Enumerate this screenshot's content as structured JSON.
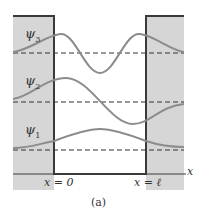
{
  "figure": {
    "caption": "(a)",
    "colors": {
      "barrier_fill": "#d6d6d6",
      "outline": "#3a3a3a",
      "wave": "#8c8c8c",
      "dashed": "#333333"
    },
    "axis": {
      "x_label": "x",
      "left_wall_label": "x = 0",
      "right_wall_label": "x = ℓ"
    },
    "wavefunctions": [
      {
        "name": "ψ",
        "subscript": "3",
        "label": "ψ3"
      },
      {
        "name": "ψ",
        "subscript": "2",
        "label": "ψ2"
      },
      {
        "name": "ψ",
        "subscript": "1",
        "label": "ψ1"
      }
    ]
  }
}
